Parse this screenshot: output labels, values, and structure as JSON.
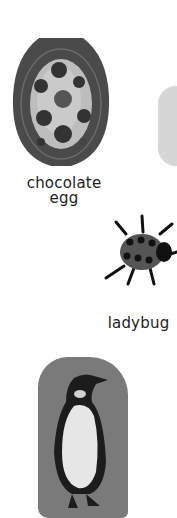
{
  "items": [
    {
      "name": "chocolate egg",
      "label_lines": [
        "chocolate",
        "egg"
      ]
    },
    {
      "name": "ladybug",
      "label": "ladybug"
    },
    {
      "name": "penguin"
    }
  ],
  "labels": {
    "egg_line1": "chocolate",
    "egg_line2": "egg",
    "ladybug": "ladybug"
  },
  "colors": {
    "background": "#ffffff",
    "egg_border": "#4a4a4a",
    "sticker_gray": "#7a7a7a",
    "partial_shape": "#d6d6d6"
  }
}
